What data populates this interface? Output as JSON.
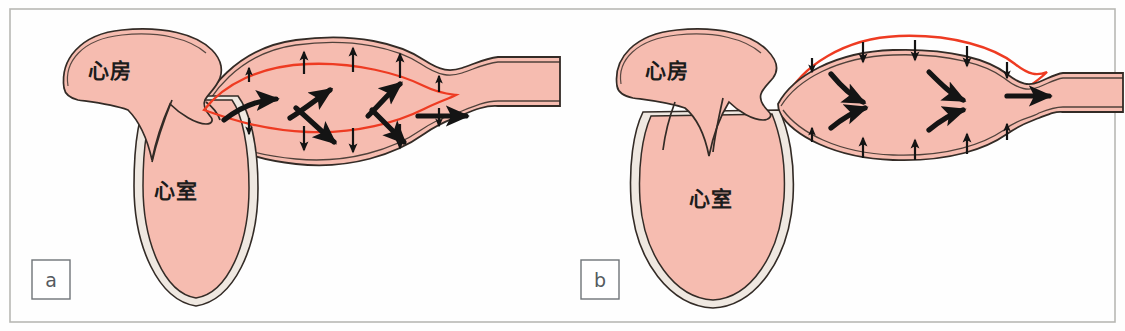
{
  "figure": {
    "background_color": "#fefefe",
    "frame_color": "#b8b8b4",
    "tissue_fill_color": "#f6bcb0",
    "tissue_outline_color": "#332b26",
    "wall_shadow_color": "#efe8e1",
    "reference_line_color": "#ee3b22",
    "arrow_color": "#141414"
  },
  "panels": [
    {
      "tag": "a",
      "phase_description": "Ventricular systole — aorta distends",
      "labels": {
        "atrium": "心房",
        "ventricle": "心室"
      },
      "reference_line_position": "inside",
      "wall_motion": "outward",
      "wall_arrow_count": 10,
      "flow_arrow_count": 6,
      "flow_direction": "diverging-outward"
    },
    {
      "tag": "b",
      "phase_description": "Ventricular diastole — elastic recoil drives flow",
      "labels": {
        "atrium": "心房",
        "ventricle": "心室"
      },
      "reference_line_position": "outside",
      "wall_motion": "inward",
      "wall_arrow_count": 10,
      "flow_arrow_count": 5,
      "flow_direction": "converging-forward"
    }
  ]
}
